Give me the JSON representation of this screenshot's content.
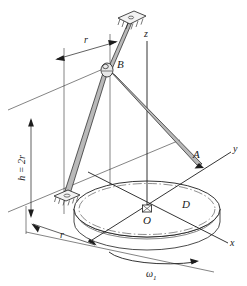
{
  "figure": {
    "background_color": "#ffffff",
    "ink_color": "#1d1d1d",
    "rod_fill_color": "#b9b9b9"
  },
  "labels": {
    "point_b": "B",
    "point_a": "A",
    "point_o": "O",
    "body_d": "D",
    "axis_x": "x",
    "axis_y": "y",
    "axis_z": "z",
    "dim_r_top": "r",
    "dim_r_bottom": "r",
    "dim_height": "h = 2r",
    "omega": "ω",
    "omega_subscript": "1"
  },
  "geometry": {
    "disk_center": {
      "x": 147,
      "y": 209
    },
    "disk_rx": 73,
    "disk_ry": 28,
    "disk_thickness": 13,
    "point_a": {
      "x": 199,
      "y": 163
    },
    "point_b": {
      "x": 107,
      "y": 69
    },
    "upper_plate": {
      "x": 131,
      "y": 17
    },
    "lower_plate": {
      "x": 66,
      "y": 196
    },
    "z_axis_top": {
      "x": 147,
      "y": 41
    },
    "y_axis_end": {
      "x": 231,
      "y": 152
    },
    "x_axis_end": {
      "x": 228,
      "y": 243
    }
  },
  "annotations": {
    "rotation_direction": "counterclockwise about z",
    "members": [
      "rod B-to-lower-support",
      "rod B-to-A"
    ]
  }
}
